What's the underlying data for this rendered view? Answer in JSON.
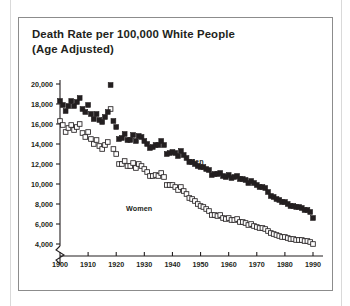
{
  "figure": {
    "title": "Death Rate per 100,000 White People\n(Age Adjusted)",
    "border_color": "#8c8c8c",
    "background": "#ffffff"
  },
  "chart_data": {
    "type": "line",
    "title": "Death Rate per 100,000 White People (Age Adjusted)",
    "subtitle": "",
    "xlabel": "",
    "ylabel": "",
    "xlim": [
      1900,
      1991
    ],
    "ylim": [
      3400,
      20000
    ],
    "grid": false,
    "axis_break": true,
    "axis_break_note": "y-axis broken below 4,000",
    "legend_position": "inline-annotation",
    "xticks": [
      1900,
      1910,
      1920,
      1930,
      1940,
      1950,
      1960,
      1970,
      1980,
      1990
    ],
    "xticklabels": [
      "1900",
      "1910",
      "1920",
      "1930",
      "1940",
      "1950",
      "1960",
      "1970",
      "1980",
      "1990"
    ],
    "yticks": [
      4000,
      6000,
      8000,
      10000,
      12000,
      14000,
      16000,
      18000,
      20000
    ],
    "yticklabels": [
      "4,000",
      "6,000",
      "8,000",
      "10,000",
      "12,000",
      "14,000",
      "16,000",
      "18,000",
      "20,000"
    ],
    "marker_styles": {
      "Men": "filled-square",
      "Women": "open-square"
    },
    "colors": {
      "Men": "#231f20",
      "Women": "#ffffff",
      "Women_edge": "#231f20"
    },
    "x": [
      1900,
      1901,
      1902,
      1903,
      1904,
      1905,
      1906,
      1907,
      1908,
      1909,
      1910,
      1911,
      1912,
      1913,
      1914,
      1915,
      1916,
      1917,
      1918,
      1919,
      1920,
      1921,
      1922,
      1923,
      1924,
      1925,
      1926,
      1927,
      1928,
      1929,
      1930,
      1931,
      1932,
      1933,
      1934,
      1935,
      1936,
      1937,
      1938,
      1939,
      1940,
      1941,
      1942,
      1943,
      1944,
      1945,
      1946,
      1947,
      1948,
      1949,
      1950,
      1951,
      1952,
      1953,
      1954,
      1955,
      1956,
      1957,
      1958,
      1959,
      1960,
      1961,
      1962,
      1963,
      1964,
      1965,
      1966,
      1967,
      1968,
      1969,
      1970,
      1971,
      1972,
      1973,
      1974,
      1975,
      1976,
      1977,
      1978,
      1979,
      1980,
      1981,
      1982,
      1983,
      1984,
      1985,
      1986,
      1987,
      1988,
      1989,
      1990
    ],
    "series": [
      {
        "name": "Men",
        "marker": "filled-square",
        "values": [
          18300,
          17900,
          17300,
          17800,
          18300,
          17800,
          18200,
          18600,
          17500,
          17200,
          17900,
          17000,
          16500,
          17000,
          16400,
          16200,
          16700,
          17200,
          19900,
          16300,
          15700,
          14500,
          14600,
          15000,
          14400,
          14400,
          14900,
          14300,
          14800,
          14700,
          14300,
          14000,
          13600,
          13700,
          13900,
          13900,
          14300,
          13900,
          13000,
          13100,
          13200,
          13100,
          12800,
          13300,
          12900,
          12600,
          12200,
          12200,
          12000,
          11800,
          11700,
          11700,
          11500,
          11400,
          10900,
          11000,
          11000,
          11100,
          10800,
          10700,
          10900,
          10600,
          10700,
          10800,
          10500,
          10500,
          10400,
          10100,
          10300,
          10100,
          9900,
          9700,
          9700,
          9600,
          9200,
          8800,
          8700,
          8500,
          8400,
          8200,
          8200,
          8000,
          7800,
          7800,
          7700,
          7700,
          7600,
          7400,
          7400,
          7200,
          6600
        ]
      },
      {
        "name": "Women",
        "marker": "open-square",
        "values": [
          16300,
          15900,
          15200,
          15600,
          15900,
          15400,
          15700,
          16000,
          15100,
          14700,
          15200,
          14500,
          14000,
          14400,
          13800,
          13500,
          13900,
          14200,
          17500,
          13500,
          13000,
          12000,
          12000,
          12300,
          11800,
          11800,
          12100,
          11600,
          12000,
          11800,
          11500,
          11200,
          10800,
          10800,
          10900,
          10800,
          11100,
          10700,
          9900,
          9900,
          9900,
          9700,
          9400,
          9700,
          9300,
          9000,
          8600,
          8500,
          8300,
          8000,
          7800,
          7700,
          7500,
          7300,
          6900,
          6900,
          6800,
          6900,
          6600,
          6500,
          6600,
          6400,
          6400,
          6500,
          6200,
          6200,
          6100,
          5900,
          6000,
          5800,
          5700,
          5600,
          5600,
          5500,
          5300,
          5100,
          5000,
          4900,
          4800,
          4700,
          4700,
          4600,
          4500,
          4500,
          4400,
          4400,
          4400,
          4300,
          4300,
          4200,
          4000
        ]
      }
    ],
    "annotations": [
      {
        "text": "Men",
        "x": 1956,
        "y": 11900
      },
      {
        "text": "Women",
        "x": 1936,
        "y": 8700
      }
    ]
  }
}
